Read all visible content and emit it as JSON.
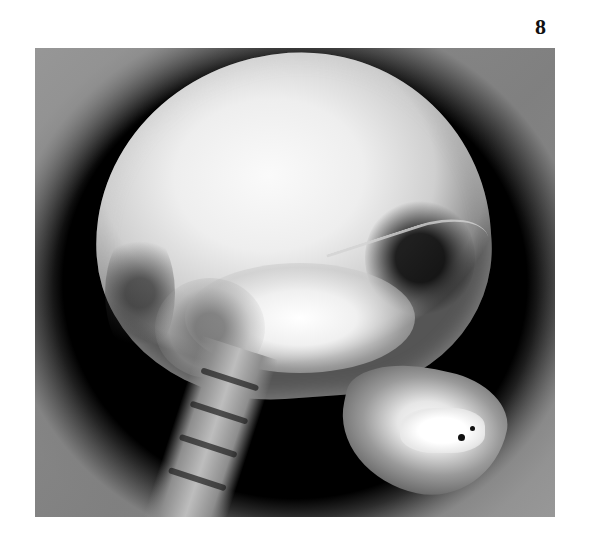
{
  "figure": {
    "number": "8",
    "image_alt": "Lateral X-ray of a human skull showing cranium, cervical spine, and mandible with teeth"
  }
}
